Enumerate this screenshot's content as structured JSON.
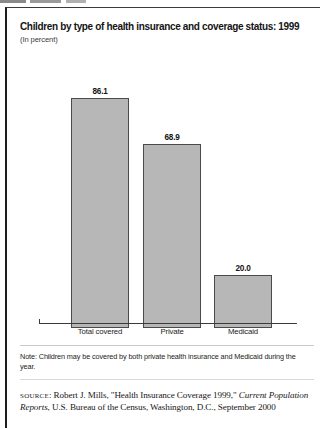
{
  "figure": {
    "top_fragment": "",
    "title": "Children by type of health insurance and coverage status: 1999",
    "subtitle": "(In percent)",
    "note_label": "Note:",
    "note_text": "Note: Children may be covered by both private health insurance and Medicaid during the year.",
    "source_label": "source",
    "source_colon": ":",
    "source_part1": " Robert J. Mills, \"Health Insurance Coverage 1999,\" ",
    "source_italic1": "Current Population Reports",
    "source_part2": ", U.S. Bureau of the Census, Washington, D.C., September 2000",
    "bar_fill_color": "#b7b7b7",
    "bar_border_color": "#4a4a4a"
  },
  "chart_data": {
    "type": "bar",
    "title": "Children by type of health insurance and coverage status: 1999",
    "subtitle": "(In percent)",
    "xlabel": "",
    "ylabel": "Percent",
    "ylim": [
      0,
      100
    ],
    "grid": false,
    "legend": "none",
    "categories": [
      "Total covered",
      "Private",
      "Medicaid"
    ],
    "values": [
      86.1,
      68.9,
      20.0
    ],
    "value_labels": [
      "86.1",
      "68.9",
      "20.0"
    ],
    "series": [
      {
        "name": "Percent of children",
        "values": [
          86.1,
          68.9,
          20.0
        ]
      }
    ]
  }
}
